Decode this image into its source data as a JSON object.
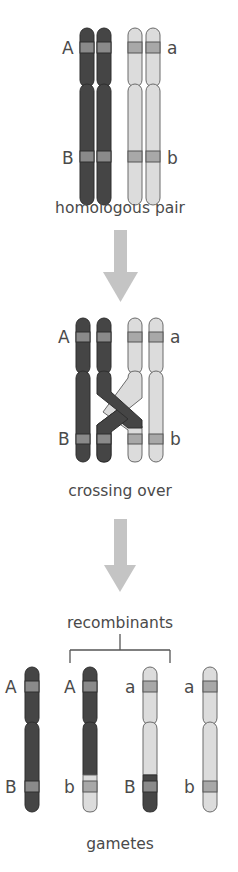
{
  "colors": {
    "dark_chromosome": "#454545",
    "dark_outline": "#2e2e2e",
    "light_chromosome": "#dcdcdc",
    "light_outline": "#6a6a6a",
    "band_dark": "#8a8a8a",
    "band_light": "#a8a8a8",
    "arrow": "#c4c4c4",
    "text": "#4a4a4a"
  },
  "stages": {
    "homologous_pair": {
      "caption": "homologous pair",
      "labels": {
        "left_top": "A",
        "left_bottom": "B",
        "right_top": "a",
        "right_bottom": "b"
      }
    },
    "crossing_over": {
      "caption": "crossing over",
      "labels": {
        "left_top": "A",
        "left_bottom": "B",
        "right_top": "a",
        "right_bottom": "b"
      }
    },
    "recombinants_label": "recombinants",
    "gametes": {
      "caption": "gametes",
      "items": [
        {
          "top": "A",
          "bottom": "B",
          "type": "parental-dark"
        },
        {
          "top": "A",
          "bottom": "b",
          "type": "recombinant"
        },
        {
          "top": "a",
          "bottom": "B",
          "type": "recombinant"
        },
        {
          "top": "a",
          "bottom": "b",
          "type": "parental-light"
        }
      ]
    }
  }
}
